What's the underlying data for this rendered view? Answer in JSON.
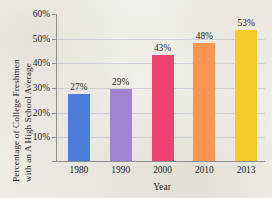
{
  "chart_data": {
    "type": "bar",
    "title": "",
    "xlabel": "Year",
    "ylabel": "Percentage of College Freshmen with an A High School Average",
    "ylabel_line1": "Percentage of College Freshmen",
    "ylabel_line2": "with an A High School Average",
    "categories": [
      "1980",
      "1990",
      "2000",
      "2010",
      "2013"
    ],
    "values": [
      27,
      29,
      43,
      48,
      53
    ],
    "data_labels": [
      "27%",
      "29%",
      "43%",
      "48%",
      "53%"
    ],
    "bar_colors": [
      "#4a7ed6",
      "#a184d1",
      "#ed4270",
      "#f79552",
      "#f6ca28"
    ],
    "ylim": [
      0,
      60
    ],
    "yticks": [
      10,
      20,
      30,
      40,
      50,
      60
    ],
    "ytick_labels": [
      "10%",
      "20%",
      "30%",
      "40%",
      "50%",
      "60%"
    ],
    "grid": true,
    "legend": "none"
  },
  "style": {
    "background": "#f3f1ec",
    "axis_color": "#8d8d93",
    "grid_color": "#cfcfd6",
    "text_color": "#232323"
  }
}
